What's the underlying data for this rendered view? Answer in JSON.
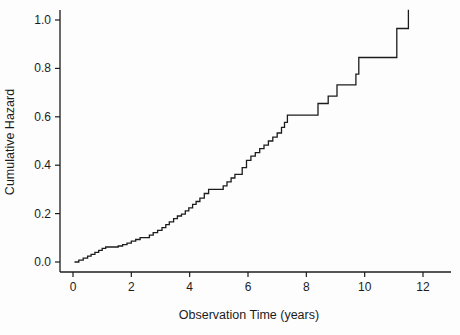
{
  "figure": {
    "background": "#fdfdfd",
    "line_color": "#1c1c1c",
    "text_color": "#1c1c1c"
  },
  "chart_data": {
    "type": "line",
    "style": "step-post",
    "title": "",
    "xlabel": "Observation Time (years)",
    "ylabel": "Cumulative Hazard",
    "grid": false,
    "legend_position": "none",
    "xlim": [
      0,
      13.3
    ],
    "ylim": [
      0,
      1.08
    ],
    "x_ticks": [
      {
        "v": 0,
        "label": "0"
      },
      {
        "v": 2,
        "label": "2"
      },
      {
        "v": 4,
        "label": "4"
      },
      {
        "v": 6,
        "label": "6"
      },
      {
        "v": 8,
        "label": "8"
      },
      {
        "v": 10,
        "label": "10"
      },
      {
        "v": 12,
        "label": "12"
      }
    ],
    "y_ticks": [
      {
        "v": 0.0,
        "label": "0.0"
      },
      {
        "v": 0.2,
        "label": "0.2"
      },
      {
        "v": 0.4,
        "label": "0.4"
      },
      {
        "v": 0.6,
        "label": "0.6"
      },
      {
        "v": 0.8,
        "label": "0.8"
      },
      {
        "v": 1.0,
        "label": "1.0"
      }
    ],
    "series": [
      {
        "name": "nelson-aalen-cumulative-hazard",
        "points": [
          [
            0.05,
            0.0
          ],
          [
            0.2,
            0.008
          ],
          [
            0.35,
            0.016
          ],
          [
            0.5,
            0.024
          ],
          [
            0.62,
            0.032
          ],
          [
            0.75,
            0.04
          ],
          [
            0.88,
            0.048
          ],
          [
            1.0,
            0.056
          ],
          [
            1.12,
            0.062
          ],
          [
            1.55,
            0.066
          ],
          [
            1.7,
            0.072
          ],
          [
            1.85,
            0.078
          ],
          [
            2.0,
            0.086
          ],
          [
            2.15,
            0.093
          ],
          [
            2.3,
            0.101
          ],
          [
            2.62,
            0.111
          ],
          [
            2.75,
            0.121
          ],
          [
            2.9,
            0.131
          ],
          [
            3.05,
            0.142
          ],
          [
            3.18,
            0.154
          ],
          [
            3.3,
            0.166
          ],
          [
            3.45,
            0.179
          ],
          [
            3.58,
            0.19
          ],
          [
            3.72,
            0.198
          ],
          [
            3.85,
            0.211
          ],
          [
            3.97,
            0.224
          ],
          [
            4.1,
            0.238
          ],
          [
            4.22,
            0.25
          ],
          [
            4.35,
            0.264
          ],
          [
            4.5,
            0.283
          ],
          [
            4.65,
            0.3
          ],
          [
            5.15,
            0.315
          ],
          [
            5.28,
            0.331
          ],
          [
            5.42,
            0.347
          ],
          [
            5.55,
            0.362
          ],
          [
            5.8,
            0.39
          ],
          [
            5.95,
            0.42
          ],
          [
            6.1,
            0.437
          ],
          [
            6.25,
            0.452
          ],
          [
            6.4,
            0.468
          ],
          [
            6.55,
            0.483
          ],
          [
            6.7,
            0.5
          ],
          [
            6.85,
            0.516
          ],
          [
            7.0,
            0.533
          ],
          [
            7.15,
            0.556
          ],
          [
            7.25,
            0.577
          ],
          [
            7.35,
            0.607
          ],
          [
            8.4,
            0.655
          ],
          [
            8.75,
            0.685
          ],
          [
            9.05,
            0.732
          ],
          [
            9.7,
            0.776
          ],
          [
            9.8,
            0.845
          ],
          [
            11.1,
            0.965
          ],
          [
            11.5,
            1.042
          ]
        ]
      }
    ]
  }
}
